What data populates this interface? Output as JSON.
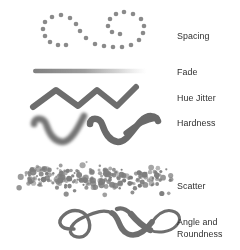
{
  "figure": {
    "background_color": "#ffffff",
    "stroke_color": "#707070",
    "stroke_color_dark": "#5d5d5d",
    "text_color": "#2e2e2e",
    "width": 240,
    "height": 250
  },
  "rows": [
    {
      "id": "spacing",
      "label": "Spacing",
      "label_x": 177,
      "label_y": 30,
      "sample_type": "dotted-loops",
      "description": "Cursive double-loop stroke rendered as evenly spaced round dots",
      "dot_color": "#8a8a8a",
      "dot_radius": 2.3,
      "dots": [
        [
          45,
          22
        ],
        [
          43,
          29
        ],
        [
          45,
          36
        ],
        [
          50,
          42
        ],
        [
          58,
          45
        ],
        [
          66,
          45
        ],
        [
          52,
          17
        ],
        [
          61,
          15
        ],
        [
          70,
          18
        ],
        [
          76,
          24
        ],
        [
          80,
          31
        ],
        [
          86,
          38
        ],
        [
          95,
          44
        ],
        [
          104,
          46
        ],
        [
          113,
          47
        ],
        [
          122,
          47
        ],
        [
          131,
          45
        ],
        [
          139,
          40
        ],
        [
          143,
          33
        ],
        [
          144,
          26
        ],
        [
          141,
          19
        ],
        [
          133,
          14
        ],
        [
          124,
          12
        ],
        [
          116,
          14
        ],
        [
          110,
          19
        ],
        [
          108,
          26
        ],
        [
          112,
          32
        ],
        [
          120,
          34
        ]
      ]
    },
    {
      "id": "fade",
      "label": "Fade",
      "label_x": 177,
      "label_y": 66,
      "sample_type": "fading-line",
      "description": "Straight horizontal stroke fading from opaque gray at left to transparent at right",
      "x_start": 33,
      "x_end": 147,
      "y": 71,
      "thickness": 4.5,
      "opacity_start": 0.85,
      "opacity_end": 0.0
    },
    {
      "id": "hue-jitter",
      "label": "Hue Jitter",
      "label_x": 177,
      "label_y": 92,
      "sample_type": "zigzag",
      "description": "Thick zigzag stroke, colors varying along its length",
      "thickness": 6,
      "points": [
        [
          33,
          107
        ],
        [
          56,
          90
        ],
        [
          78,
          106
        ],
        [
          97,
          90
        ],
        [
          117,
          106
        ],
        [
          136,
          87
        ]
      ]
    },
    {
      "id": "hardness",
      "label": "Hardness",
      "label_x": 177,
      "label_y": 117,
      "sample_type": "paired-squiggle",
      "description": "Two cursive v-shaped squiggles: left soft-edged, right hard-edged",
      "thickness": 6.5,
      "soft_blur": 1.6,
      "hard_blur": 0.25,
      "soft_points": [
        [
          34,
          126
        ],
        [
          40,
          120
        ],
        [
          48,
          123
        ],
        [
          53,
          136
        ],
        [
          62,
          142
        ],
        [
          72,
          132
        ],
        [
          80,
          120
        ],
        [
          84,
          116
        ]
      ],
      "hard_points": [
        [
          90,
          126
        ],
        [
          96,
          120
        ],
        [
          104,
          123
        ],
        [
          109,
          136
        ],
        [
          118,
          142
        ],
        [
          128,
          130
        ],
        [
          140,
          120
        ],
        [
          152,
          118
        ],
        [
          158,
          121
        ]
      ]
    },
    {
      "id": "scatter",
      "label": "Scatter",
      "label_x": 177,
      "label_y": 180,
      "sample_type": "scatter-band",
      "description": "Dense horizontal band of randomly scattered dots of varying size",
      "dot_color": "#7d7d7d",
      "band_x_start": 18,
      "band_x_end": 172,
      "band_y_center": 178,
      "band_height": 36,
      "dot_count": 230,
      "dot_radius_min": 1.0,
      "dot_radius_max": 3.2
    },
    {
      "id": "angle-roundness",
      "label": "Angle and\nRoundness",
      "label_x": 177,
      "label_y": 216,
      "sample_type": "calligraphic-flourish",
      "description": "Calligraphic cursive e-n flourish with stroke width varying by angle",
      "thickness_min": 2.5,
      "thickness_max": 7.5
    }
  ]
}
